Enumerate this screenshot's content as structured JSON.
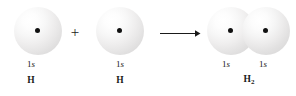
{
  "figure": {
    "type": "chemistry-orbital-overlap-diagram",
    "background_color": "#ffffff",
    "dot_color": "#111111",
    "line_color": "#1a1a1a"
  },
  "reactant_left": {
    "orbital_label_prefix": "1",
    "orbital_label_italic": "s",
    "species_label": "H",
    "nucleus": "nucleus-dot"
  },
  "operator": {
    "symbol": "+"
  },
  "reactant_right": {
    "orbital_label_prefix": "1",
    "orbital_label_italic": "s",
    "species_label": "H",
    "nucleus": "nucleus-dot"
  },
  "arrow": {
    "symbol": "reaction-arrow",
    "direction": "right"
  },
  "product": {
    "orbital_left": {
      "orbital_label_prefix": "1",
      "orbital_label_italic": "s"
    },
    "orbital_right": {
      "orbital_label_prefix": "1",
      "orbital_label_italic": "s"
    },
    "species_label_base": "H",
    "species_label_subscript": "2"
  }
}
